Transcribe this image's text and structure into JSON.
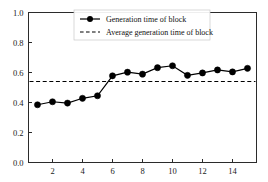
{
  "chart_data": {
    "type": "line",
    "title": "",
    "xlabel": "",
    "ylabel": "",
    "xlim": [
      0.4,
      15.6
    ],
    "ylim": [
      0.0,
      1.0
    ],
    "grid": false,
    "legend_position": "top-center",
    "x": [
      1,
      2,
      3,
      4,
      5,
      6,
      7,
      8,
      9,
      10,
      11,
      12,
      13,
      14,
      15
    ],
    "xticks": [
      2,
      4,
      6,
      8,
      10,
      12,
      14
    ],
    "xtick_labels": [
      "2",
      "4",
      "6",
      "8",
      "10",
      "12",
      "14"
    ],
    "yticks": [
      0.0,
      0.2,
      0.4,
      0.6,
      0.8,
      1.0
    ],
    "ytick_labels": [
      "0.0",
      "0.2",
      "0.4",
      "0.6",
      "0.8",
      "1.0"
    ],
    "series": [
      {
        "name": "Generation time of block",
        "style": "line-marker",
        "color": "#000000",
        "values": [
          0.385,
          0.405,
          0.396,
          0.428,
          0.445,
          0.578,
          0.602,
          0.589,
          0.632,
          0.645,
          0.581,
          0.597,
          0.617,
          0.604,
          0.628
        ]
      },
      {
        "name": "Average generation time of block",
        "style": "dashed",
        "color": "#000000",
        "value": 0.54
      }
    ],
    "legend": [
      {
        "label": "Generation time of block",
        "marker": "line-circle"
      },
      {
        "label": "Average generation time of block",
        "marker": "dashed-line"
      }
    ]
  },
  "axes": {
    "y_labels": [
      "1.0",
      "0.8",
      "0.6",
      "0.4",
      "0.2",
      "0.0"
    ],
    "x_labels": [
      "2",
      "4",
      "6",
      "8",
      "10",
      "12",
      "14"
    ]
  },
  "legend": {
    "series_label": "Generation time of block",
    "average_label": "Average generation time of block"
  }
}
